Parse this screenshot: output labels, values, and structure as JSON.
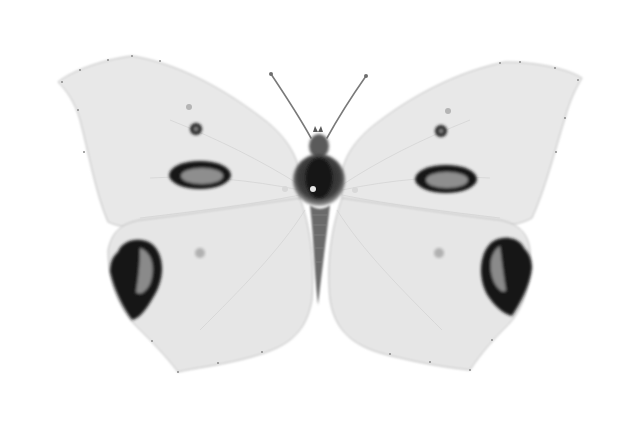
{
  "image": {
    "subject": "butterfly specimen",
    "view": "dorsal, wings spread",
    "palette": {
      "background": "#ffffff",
      "wing": "#e9e9e9",
      "wing_edge": "#8a8a8a",
      "spot_dark": "#161616",
      "spot_inner": "#9a9a9a",
      "body": "#3a3a3a",
      "vein": "#cfcfcf"
    }
  }
}
